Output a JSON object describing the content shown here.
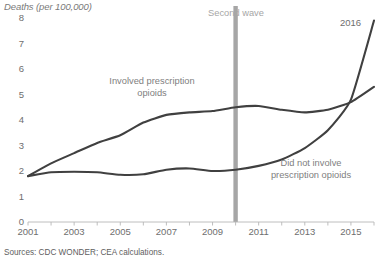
{
  "chart_data": {
    "type": "line",
    "title": "Deaths (per 100,000)",
    "xlabel": "",
    "ylabel": "Deaths (per 100,000)",
    "xlim": [
      2001,
      2016
    ],
    "ylim": [
      0,
      8
    ],
    "ytick_step": 1,
    "yticks": [
      "8",
      "7",
      "6",
      "5",
      "4",
      "3",
      "2",
      "1",
      "0"
    ],
    "xticks": [
      "2001",
      "2003",
      "2005",
      "2007",
      "2009",
      "2011",
      "2013",
      "2015"
    ],
    "grid": false,
    "legend": "inline-annotations",
    "x": [
      2001,
      2002,
      2003,
      2004,
      2005,
      2006,
      2007,
      2008,
      2009,
      2010,
      2011,
      2012,
      2013,
      2014,
      2015,
      2016
    ],
    "series": [
      {
        "name": "Involved prescription opioids",
        "color": "#404040",
        "values": [
          1.8,
          2.3,
          2.7,
          3.1,
          3.4,
          3.9,
          4.2,
          4.3,
          4.35,
          4.5,
          4.55,
          4.4,
          4.3,
          4.4,
          4.7,
          5.3
        ]
      },
      {
        "name": "Did not involve prescription opioids",
        "color": "#404040",
        "values": [
          1.8,
          1.95,
          1.97,
          1.95,
          1.85,
          1.87,
          2.05,
          2.1,
          2.0,
          2.05,
          2.2,
          2.45,
          2.9,
          3.6,
          4.8,
          7.9
        ]
      }
    ],
    "annotations": [
      {
        "name": "involved-prescription-opioids-label",
        "text": "Involved prescription\nopioids",
        "line1": "Involved prescription",
        "line2": "opioids"
      },
      {
        "name": "did-not-involve-prescription-opioids-label",
        "text": "Did not involve\nprescription opioids",
        "line1": "Did not involve",
        "line2": "prescription opioids"
      },
      {
        "name": "second-wave-marker-label",
        "text": "Second wave",
        "marker_year": 2010,
        "marker_color": "#a6a6a6"
      },
      {
        "name": "end-year-label",
        "text": "2016"
      }
    ]
  },
  "footer": {
    "sources": "Sources: CDC WONDER; CEA calculations.",
    "note": ""
  }
}
